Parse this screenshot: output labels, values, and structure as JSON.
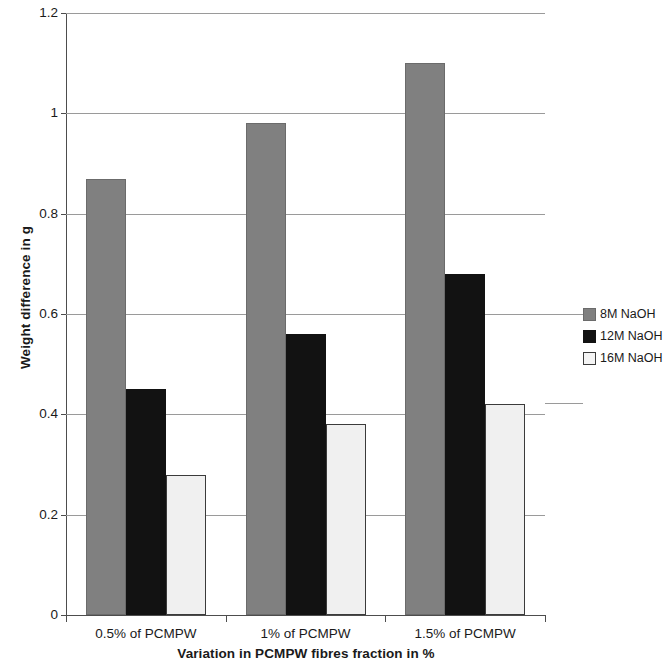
{
  "chart_data": {
    "type": "bar",
    "title": "",
    "xlabel": "Variation in PCMPW fibres fraction in %",
    "ylabel": "Weight difference in g",
    "categories": [
      "0.5% of PCMPW",
      "1% of PCMPW",
      "1.5% of PCMPW"
    ],
    "series": [
      {
        "name": "8M NaOH",
        "color": "#808080",
        "values": [
          0.87,
          0.98,
          1.1
        ]
      },
      {
        "name": "12M NaOH",
        "color": "#121212",
        "values": [
          0.45,
          0.56,
          0.68
        ]
      },
      {
        "name": "16M NaOH",
        "color": "#f0f0f0",
        "values": [
          0.28,
          0.38,
          0.42
        ]
      }
    ],
    "ylim": [
      0,
      1.2
    ],
    "ytick_labels": [
      "1.2",
      "1",
      "0.8",
      "0.6",
      "0.4",
      "0.2",
      "0"
    ],
    "ytick_values": [
      1.2,
      1.0,
      0.8,
      0.6,
      0.4,
      0.2,
      0.0
    ],
    "grid": true,
    "legend_position": "right"
  },
  "legend": {
    "entries": [
      {
        "label": "8M NaOH"
      },
      {
        "label": "12M NaOH"
      },
      {
        "label": "16M NaOH"
      }
    ]
  },
  "axes": {
    "y_title": "Weight difference in g",
    "x_title": "Variation in PCMPW fibres fraction in %"
  }
}
